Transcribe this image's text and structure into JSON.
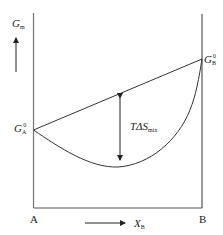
{
  "diagram": {
    "type": "Gibbs free energy of mixing curve",
    "y_axis": {
      "symbol": "G",
      "subscript": "m"
    },
    "x_axis": {
      "symbol": "X",
      "subscript": "B"
    },
    "left_end": {
      "label": "A",
      "point": {
        "symbol": "G",
        "subscript": "A",
        "superscript": "0"
      }
    },
    "right_end": {
      "label": "B",
      "point": {
        "symbol": "G",
        "subscript": "B",
        "superscript": "0"
      }
    },
    "annotation": {
      "prefix": "TΔS",
      "subscript": "mix"
    },
    "colors": {
      "line": "#333333",
      "frame": "#666666",
      "background": "#ffffff"
    }
  }
}
